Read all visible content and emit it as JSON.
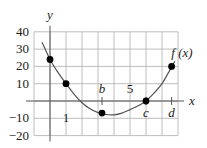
{
  "chart_data": {
    "type": "line",
    "title": "",
    "xlabel": "x",
    "ylabel": "y",
    "curve_label": "f (x)",
    "xlim": [
      -1,
      8
    ],
    "ylim": [
      -20,
      40
    ],
    "grid": true,
    "x_ticks": [
      {
        "value": 1,
        "label": "1"
      },
      {
        "value": 5,
        "label": "5"
      }
    ],
    "y_ticks": [
      {
        "value": 40,
        "label": "40"
      },
      {
        "value": 30,
        "label": "30"
      },
      {
        "value": 20,
        "label": "20"
      },
      {
        "value": 10,
        "label": "10"
      },
      {
        "value": -10,
        "label": "−10"
      },
      {
        "value": -20,
        "label": "−20"
      }
    ],
    "marked_x": [
      {
        "name": "b",
        "value": 3.25
      },
      {
        "name": "c",
        "value": 6
      },
      {
        "name": "d",
        "value": 7.6
      }
    ],
    "points": [
      {
        "x": 0,
        "y": 24
      },
      {
        "x": 1,
        "y": 10
      },
      {
        "x": 3.25,
        "y": -7
      },
      {
        "x": 6,
        "y": 0
      },
      {
        "x": 7.6,
        "y": 20
      }
    ],
    "series": [
      {
        "name": "f(x)",
        "x": [
          -0.5,
          0,
          0.5,
          1,
          1.5,
          2,
          2.5,
          3,
          3.5,
          4,
          4.5,
          5,
          5.5,
          6,
          6.5,
          7,
          7.5,
          7.8
        ],
        "y": [
          34,
          24,
          16.5,
          10,
          4,
          -1,
          -4.5,
          -6.7,
          -7.8,
          -8,
          -7,
          -5,
          -2.8,
          0,
          4.5,
          10,
          18,
          23
        ]
      }
    ],
    "colors": {
      "curve": "#555555",
      "grid": "#bdbdbd",
      "axis": "#555555",
      "point": "#000000"
    }
  }
}
